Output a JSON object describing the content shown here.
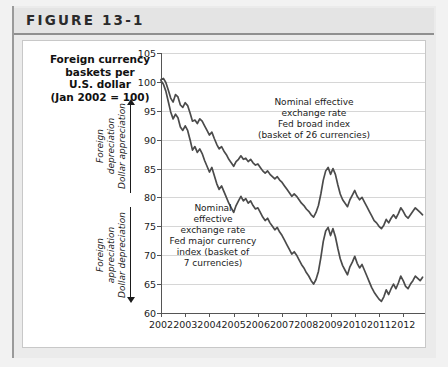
{
  "figure": {
    "header_label": "FIGURE 13-1"
  },
  "chart_title": {
    "line1": "Foreign currency",
    "line2": "baskets per",
    "line3": "U.S. dollar",
    "line4": "(Jan 2002 = 100)"
  },
  "direction_labels": {
    "upper": {
      "line1": "Foreign",
      "line2": "depreciation",
      "line3": "Dollar appreciation"
    },
    "lower": {
      "line1": "Foreign",
      "line2": "appreciation",
      "line3": "Dollar depreciation"
    }
  },
  "annotations": {
    "broad": {
      "line1": "Nominal effective",
      "line2": "exchange rate",
      "line3": "Fed broad index",
      "line4": "(basket of 26 currencies)"
    },
    "major": {
      "line1": "Nominal",
      "line2": "effective",
      "line3": "exchange rate",
      "line4": "Fed major currency",
      "line5": "index (basket of",
      "line6": "7 currencies)"
    }
  },
  "colors": {
    "series_line": "#4b4b4b",
    "gridline": "#d6d6d6",
    "axis": "#555555",
    "card_background": "#ffffff",
    "page_background": "#f2f2f2",
    "header_background": "#e4e4e4"
  },
  "chart_data": {
    "type": "line",
    "title": "Foreign currency baskets per U.S. dollar (Jan 2002 = 100)",
    "xlabel": "",
    "ylabel": "Foreign currency baskets per U.S. dollar (Jan 2002 = 100)",
    "xlim": [
      2002,
      2012.9
    ],
    "ylim": [
      60,
      105
    ],
    "ytick_values": [
      60,
      65,
      70,
      75,
      80,
      85,
      90,
      95,
      100,
      105
    ],
    "xtick_values": [
      2002,
      2003,
      2004,
      2005,
      2006,
      2007,
      2008,
      2009,
      2010,
      2011,
      2012
    ],
    "xtick_labels": [
      "2002",
      "2003",
      "2004",
      "2005",
      "2006",
      "2007",
      "2008",
      "2009",
      "2010",
      "2011",
      "2012"
    ],
    "grid": true,
    "legend": "annotations-in-plot",
    "series": [
      {
        "name": "Nominal effective exchange rate Fed broad index (basket of 26 currencies)",
        "x": [
          2002.0,
          2002.1,
          2002.2,
          2002.3,
          2002.4,
          2002.5,
          2002.6,
          2002.7,
          2002.8,
          2002.9,
          2003.0,
          2003.1,
          2003.2,
          2003.3,
          2003.4,
          2003.5,
          2003.6,
          2003.7,
          2003.8,
          2003.9,
          2004.0,
          2004.1,
          2004.2,
          2004.3,
          2004.4,
          2004.5,
          2004.6,
          2004.7,
          2004.8,
          2004.9,
          2005.0,
          2005.1,
          2005.2,
          2005.3,
          2005.4,
          2005.5,
          2005.6,
          2005.7,
          2005.8,
          2005.9,
          2006.0,
          2006.1,
          2006.2,
          2006.3,
          2006.4,
          2006.5,
          2006.6,
          2006.7,
          2006.8,
          2006.9,
          2007.0,
          2007.1,
          2007.2,
          2007.3,
          2007.4,
          2007.5,
          2007.6,
          2007.7,
          2007.8,
          2007.9,
          2008.0,
          2008.1,
          2008.2,
          2008.3,
          2008.4,
          2008.5,
          2008.6,
          2008.7,
          2008.8,
          2008.9,
          2009.0,
          2009.1,
          2009.2,
          2009.3,
          2009.4,
          2009.5,
          2009.6,
          2009.7,
          2009.8,
          2009.9,
          2010.0,
          2010.1,
          2010.2,
          2010.3,
          2010.4,
          2010.5,
          2010.6,
          2010.7,
          2010.8,
          2010.9,
          2011.0,
          2011.1,
          2011.2,
          2011.3,
          2011.4,
          2011.5,
          2011.6,
          2011.7,
          2011.8,
          2011.9,
          2012.0,
          2012.1,
          2012.2,
          2012.3,
          2012.4,
          2012.5,
          2012.6,
          2012.7,
          2012.8
        ],
        "values": [
          100.4,
          100.6,
          99.9,
          98.6,
          97.2,
          96.5,
          97.8,
          97.4,
          96.0,
          95.6,
          96.4,
          95.9,
          94.6,
          93.2,
          93.4,
          92.8,
          93.6,
          93.2,
          92.4,
          91.6,
          90.8,
          91.3,
          90.2,
          89.2,
          88.4,
          88.8,
          88.0,
          87.4,
          86.6,
          86.0,
          85.4,
          86.2,
          86.6,
          87.2,
          86.6,
          86.8,
          86.2,
          86.6,
          86.0,
          85.6,
          85.8,
          85.2,
          84.6,
          84.2,
          84.6,
          84.0,
          83.6,
          83.2,
          83.6,
          83.0,
          82.6,
          82.0,
          81.4,
          80.8,
          80.2,
          80.6,
          80.2,
          79.6,
          79.0,
          78.6,
          78.0,
          77.6,
          77.0,
          76.6,
          77.4,
          78.6,
          80.6,
          83.0,
          84.6,
          85.2,
          84.0,
          85.0,
          84.0,
          82.2,
          80.6,
          79.6,
          79.0,
          78.4,
          79.6,
          80.4,
          81.2,
          80.2,
          79.6,
          80.0,
          79.2,
          78.4,
          77.6,
          76.8,
          76.0,
          75.6,
          75.0,
          74.6,
          75.2,
          76.2,
          75.6,
          76.4,
          77.0,
          76.4,
          77.2,
          78.2,
          77.6,
          76.8,
          76.4,
          77.0,
          77.6,
          78.2,
          77.8,
          77.4,
          77.0
        ]
      },
      {
        "name": "Nominal effective exchange rate Fed major currency index (basket of 7 currencies)",
        "x": [
          2002.0,
          2002.1,
          2002.2,
          2002.3,
          2002.4,
          2002.5,
          2002.6,
          2002.7,
          2002.8,
          2002.9,
          2003.0,
          2003.1,
          2003.2,
          2003.3,
          2003.4,
          2003.5,
          2003.6,
          2003.7,
          2003.8,
          2003.9,
          2004.0,
          2004.1,
          2004.2,
          2004.3,
          2004.4,
          2004.5,
          2004.6,
          2004.7,
          2004.8,
          2004.9,
          2005.0,
          2005.1,
          2005.2,
          2005.3,
          2005.4,
          2005.5,
          2005.6,
          2005.7,
          2005.8,
          2005.9,
          2006.0,
          2006.1,
          2006.2,
          2006.3,
          2006.4,
          2006.5,
          2006.6,
          2006.7,
          2006.8,
          2006.9,
          2007.0,
          2007.1,
          2007.2,
          2007.3,
          2007.4,
          2007.5,
          2007.6,
          2007.7,
          2007.8,
          2007.9,
          2008.0,
          2008.1,
          2008.2,
          2008.3,
          2008.4,
          2008.5,
          2008.6,
          2008.7,
          2008.8,
          2008.9,
          2009.0,
          2009.1,
          2009.2,
          2009.3,
          2009.4,
          2009.5,
          2009.6,
          2009.7,
          2009.8,
          2009.9,
          2010.0,
          2010.1,
          2010.2,
          2010.3,
          2010.4,
          2010.5,
          2010.6,
          2010.7,
          2010.8,
          2010.9,
          2011.0,
          2011.1,
          2011.2,
          2011.3,
          2011.4,
          2011.5,
          2011.6,
          2011.7,
          2011.8,
          2011.9,
          2012.0,
          2012.1,
          2012.2,
          2012.3,
          2012.4,
          2012.5,
          2012.6,
          2012.7,
          2012.8
        ],
        "values": [
          100.2,
          99.6,
          98.4,
          96.6,
          94.8,
          93.6,
          94.4,
          93.8,
          92.2,
          91.6,
          92.4,
          91.6,
          90.0,
          88.2,
          88.8,
          87.8,
          88.4,
          87.6,
          86.4,
          85.4,
          84.4,
          85.2,
          83.8,
          82.4,
          81.4,
          82.0,
          81.0,
          80.0,
          79.0,
          78.2,
          77.4,
          78.6,
          79.4,
          80.2,
          79.4,
          79.8,
          79.0,
          79.4,
          78.6,
          78.0,
          78.2,
          77.4,
          76.6,
          76.0,
          76.4,
          75.6,
          75.0,
          74.4,
          74.8,
          74.0,
          73.4,
          72.6,
          71.8,
          71.0,
          70.2,
          70.6,
          70.0,
          69.2,
          68.4,
          67.8,
          67.0,
          66.4,
          65.6,
          65.0,
          65.8,
          67.2,
          69.6,
          72.4,
          74.2,
          74.8,
          73.4,
          74.6,
          73.2,
          71.2,
          69.4,
          68.2,
          67.4,
          66.6,
          68.0,
          68.8,
          69.8,
          68.6,
          67.8,
          68.4,
          67.4,
          66.4,
          65.4,
          64.4,
          63.6,
          63.0,
          62.4,
          62.0,
          62.8,
          64.0,
          63.2,
          64.2,
          65.0,
          64.2,
          65.2,
          66.4,
          65.6,
          64.6,
          64.2,
          65.0,
          65.6,
          66.4,
          66.0,
          65.6,
          66.2
        ]
      }
    ]
  }
}
